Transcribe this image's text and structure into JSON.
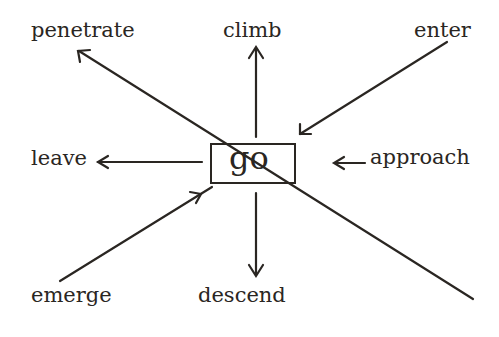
{
  "diagram": {
    "center": {
      "label": "go"
    },
    "directions": [
      {
        "id": "penetrate",
        "label": "penetrate",
        "arrow": "outward"
      },
      {
        "id": "climb",
        "label": "climb",
        "arrow": "outward"
      },
      {
        "id": "enter",
        "label": "enter",
        "arrow": "inward"
      },
      {
        "id": "leave",
        "label": "leave",
        "arrow": "outward"
      },
      {
        "id": "approach",
        "label": "approach",
        "arrow": "inward"
      },
      {
        "id": "emerge",
        "label": "emerge",
        "arrow": "outward"
      },
      {
        "id": "descend",
        "label": "descend",
        "arrow": "outward"
      }
    ],
    "colors": {
      "ink": "#2a2622",
      "background": "#ffffff"
    }
  }
}
